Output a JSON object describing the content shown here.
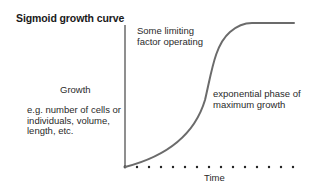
{
  "diagram": {
    "title": "Sigmoid growth curve",
    "y_axis_label": "Growth",
    "y_axis_examples": [
      "e.g. number of cells or",
      "individuals, volume,",
      "length, etc."
    ],
    "x_axis_label": "Time",
    "annotations": {
      "plateau": [
        "Some limiting",
        "factor operating"
      ],
      "exponential": [
        "exponential phase of",
        "maximum growth"
      ]
    },
    "colors": {
      "axis": "#333333",
      "curve": "#6b6b6b",
      "text": "#1a1a1a"
    }
  }
}
